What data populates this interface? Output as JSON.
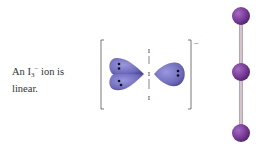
{
  "caption": {
    "prefix": "An I",
    "subscript": "3",
    "superscript": "−",
    "suffix": " ion is",
    "line2": "linear."
  },
  "lewis_diagram": {
    "atoms": [
      "I",
      "I",
      "I"
    ],
    "charge": "−",
    "lone_pair_lobes": 3,
    "lobe_color": "#7b78c4"
  },
  "ball_and_stick": {
    "atoms": 3,
    "orientation": "vertical",
    "atom_color": "#7a3c9a",
    "bond_color": "#c8b8bf"
  }
}
